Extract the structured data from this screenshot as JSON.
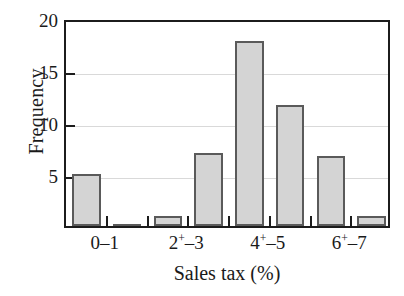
{
  "chart_data": {
    "type": "bar",
    "title": "",
    "subtitle": "",
    "xlabel": "Sales tax (%)",
    "ylabel": "Frequency",
    "categories": [
      "0-1",
      "1+-2",
      "2+-3",
      "3+-4",
      "4+-5",
      "5+-6",
      "6+-7",
      "7+-8"
    ],
    "values": [
      5.0,
      0.1,
      1.0,
      7.0,
      17.8,
      11.6,
      6.7,
      1.0
    ],
    "ylim": [
      0,
      20
    ],
    "ytick_labels": [
      "5",
      "10",
      "15",
      "20"
    ],
    "ytick_values": [
      5,
      10,
      15,
      20
    ],
    "xtick_labels": [
      {
        "base": "0",
        "plus": "",
        "dash": "–",
        "end": "1"
      },
      {
        "base": "2",
        "plus": "+",
        "dash": "–",
        "end": "3"
      },
      {
        "base": "4",
        "plus": "+",
        "dash": "–",
        "end": "5"
      },
      {
        "base": "6",
        "plus": "+",
        "dash": "–",
        "end": "7"
      }
    ],
    "grid": true,
    "grid_axis": "y",
    "legend": "none",
    "bar_fill_color": "#d4d4d4",
    "bar_edge_color": "#5a5a5a",
    "axis_color": "#1c1c1c",
    "grid_color": "#d9d9d9",
    "background_color": "#ffffff"
  }
}
